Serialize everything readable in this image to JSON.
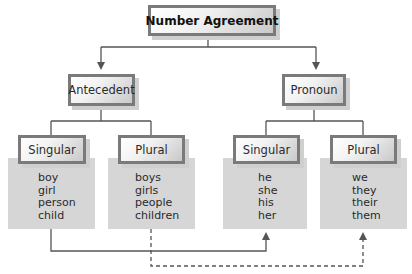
{
  "diagram": {
    "title": "Number Agreement",
    "branches": [
      {
        "label": "Antecedent",
        "groups": [
          {
            "label": "Singular",
            "words": [
              "boy",
              "girl",
              "person",
              "child"
            ]
          },
          {
            "label": "Plural",
            "words": [
              "boys",
              "girls",
              "people",
              "children"
            ]
          }
        ]
      },
      {
        "label": "Pronoun",
        "groups": [
          {
            "label": "Singular",
            "words": [
              "he",
              "she",
              "his",
              "her"
            ]
          },
          {
            "label": "Plural",
            "words": [
              "we",
              "they",
              "their",
              "them"
            ]
          }
        ]
      }
    ],
    "connections": [
      {
        "from": "Antecedent Singular",
        "to": "Pronoun Singular",
        "style": "solid"
      },
      {
        "from": "Antecedent Plural",
        "to": "Pronoun Plural",
        "style": "dashed"
      }
    ],
    "colors": {
      "box_border": "#7a7a7a",
      "panel_fill": "#d6d6d6",
      "line": "#555555"
    }
  }
}
